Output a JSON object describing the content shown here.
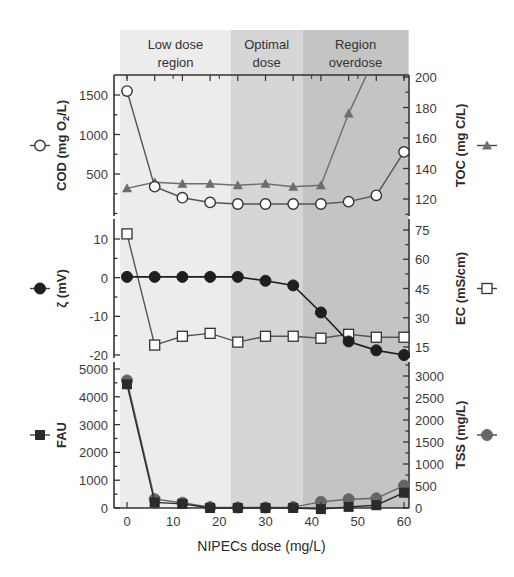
{
  "chart_data": {
    "type": "line",
    "layout": "three vertically stacked panels sharing x-axis, each with dual y-axes; shaded dose regions",
    "x": [
      0,
      6,
      12,
      18,
      24,
      30,
      36,
      42,
      48,
      54,
      60
    ],
    "xlabel": "NIPECs dose (mg/L)",
    "xticks": [
      0,
      10,
      20,
      30,
      40,
      50,
      60
    ],
    "xlim": [
      -1.5,
      61
    ],
    "regions": [
      {
        "label_line1": "Low dose",
        "label_line2": "region",
        "x_start": -1.5,
        "x_end": 22.5,
        "color": "#ececec"
      },
      {
        "label_line1": "Optimal",
        "label_line2": "dose",
        "x_start": 22.5,
        "x_end": 38,
        "color": "#d6d6d6"
      },
      {
        "label_line1": "Region",
        "label_line2": "overdose",
        "x_start": 38,
        "x_end": 61,
        "color": "#c4c4c4"
      }
    ],
    "panels": [
      {
        "name": "COD/TOC",
        "left_axis": {
          "label": "COD (mg O2/L)",
          "ticks": [
            500,
            1000,
            1500
          ],
          "ylim": [
            0,
            1750
          ]
        },
        "right_axis": {
          "label": "TOC (mg C/L)",
          "ticks": [
            120,
            140,
            160,
            180,
            200
          ],
          "ylim": [
            110,
            200
          ]
        },
        "series": [
          {
            "name": "COD",
            "axis": "left",
            "marker": "open-circle",
            "color": "#555555",
            "values": [
              1550,
              340,
              200,
              140,
              120,
              120,
              120,
              120,
              150,
              230,
              780
            ]
          },
          {
            "name": "TOC",
            "axis": "right",
            "marker": "filled-triangle",
            "color": "#6e6e6e",
            "values": [
              127,
              131,
              130,
              130,
              129,
              130,
              128,
              129,
              176,
              215,
              null
            ]
          }
        ]
      },
      {
        "name": "Zeta/EC",
        "left_axis": {
          "label": "ζ (mV)",
          "ticks": [
            -20,
            -10,
            0,
            10
          ],
          "ylim": [
            -20,
            15
          ]
        },
        "right_axis": {
          "label": "EC (mS/cm)",
          "ticks": [
            15,
            30,
            45,
            60,
            75
          ],
          "ylim": [
            11,
            80
          ]
        },
        "series": [
          {
            "name": "Zeta potential",
            "axis": "left",
            "marker": "filled-circle",
            "color": "#1e1e1e",
            "values": [
              0.2,
              0.2,
              0.2,
              0.2,
              0.2,
              -0.8,
              -2,
              -9,
              -16.5,
              -18.8,
              -20
            ]
          },
          {
            "name": "EC",
            "axis": "right",
            "marker": "open-square",
            "color": "#555555",
            "values": [
              73,
              16,
              20.5,
              22,
              17.5,
              20.5,
              20.5,
              19.5,
              21.5,
              20,
              20
            ]
          }
        ]
      },
      {
        "name": "FAU/TSS",
        "left_axis": {
          "label": "FAU",
          "ticks": [
            0,
            1000,
            2000,
            3000,
            4000,
            5000
          ],
          "ylim": [
            0,
            5000
          ]
        },
        "right_axis": {
          "label": "TSS (mg/L)",
          "ticks": [
            0,
            500,
            1000,
            1500,
            2000,
            2500,
            3000
          ],
          "ylim": [
            0,
            3100
          ]
        },
        "series": [
          {
            "name": "FAU",
            "axis": "left",
            "marker": "filled-square",
            "color": "#2a2a2a",
            "values": [
              4450,
              200,
              150,
              0,
              0,
              0,
              0,
              -40,
              40,
              100,
              550
            ]
          },
          {
            "name": "TSS",
            "axis": "right",
            "marker": "filled-circle",
            "color": "#666666",
            "values": [
              2900,
              200,
              120,
              20,
              10,
              10,
              20,
              140,
              200,
              220,
              510
            ]
          }
        ]
      }
    ]
  }
}
